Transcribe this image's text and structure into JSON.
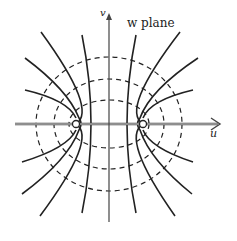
{
  "figure": {
    "title": "w plane",
    "axes": {
      "horizontal": "u",
      "vertical": "v"
    },
    "curves": {
      "solid": "confocal hyperbolas",
      "dashed": "confocal ellipses"
    },
    "foci_markers": 2,
    "colors": {
      "ink": "#222222",
      "background": "#ffffff"
    }
  }
}
